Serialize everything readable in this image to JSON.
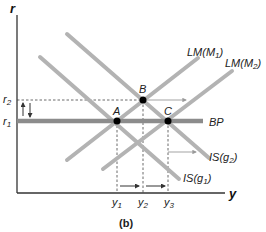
{
  "figure": {
    "caption": "(b)",
    "axes": {
      "y_label": "r",
      "x_label": "y"
    },
    "curves": {
      "lm1": "LM(M",
      "lm1_sub": "1",
      "lm2": "LM(M",
      "lm2_sub": "2",
      "bp": "BP",
      "is2": "IS(g",
      "is2_sub": "2",
      "is1": "IS(g",
      "is1_sub": "1",
      "close_paren": ")"
    },
    "points": {
      "a": "A",
      "b": "B",
      "c": "C"
    },
    "rates": {
      "r1": "r",
      "r1_sub": "1",
      "r2": "r",
      "r2_sub": "2"
    },
    "outputs": {
      "y1": "y",
      "y1_sub": "1",
      "y2": "y",
      "y2_sub": "2",
      "y3": "y",
      "y3_sub": "3"
    },
    "colors": {
      "curve": "#b3b3b3",
      "bp": "#8c8c8c",
      "axis": "#333333",
      "point": "#000000"
    }
  }
}
